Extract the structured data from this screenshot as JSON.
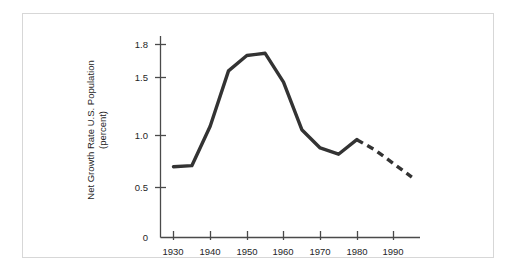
{
  "figure": {
    "background_color": "#ffffff",
    "frame_color": "#d7d7d7",
    "ink_color": "#333333",
    "text_color": "#262626"
  },
  "chart_data": {
    "type": "line",
    "title": "",
    "subtitle": "",
    "xlabel": "",
    "ylabel": "Net Growth Rate U.S. Population (percent)",
    "ylabel_line1": "Net Growth Rate U.S. Population",
    "ylabel_line2": "(percent)",
    "xlim": [
      1927,
      1998
    ],
    "ylim": [
      0,
      1.95
    ],
    "grid": false,
    "legend": "none",
    "xticks": [
      1930,
      1940,
      1950,
      1960,
      1970,
      1980,
      1990
    ],
    "xtick_labels": [
      "1930",
      "1940",
      "1950",
      "1960",
      "1970",
      "1980",
      "1990"
    ],
    "yticks": [
      0,
      0.5,
      1.0,
      1.5,
      1.8
    ],
    "ytick_labels": [
      "0",
      "0.5",
      "1.0",
      "1.5",
      "1.8"
    ],
    "series": [
      {
        "name": "Observed net growth rate",
        "style": "solid",
        "line_width": 3.4,
        "color": "#333333",
        "x": [
          1930,
          1935,
          1940,
          1945,
          1950,
          1955,
          1960,
          1965,
          1970,
          1975,
          1980
        ],
        "values": [
          0.7,
          0.71,
          1.08,
          1.56,
          1.7,
          1.72,
          1.46,
          1.05,
          0.88,
          0.82,
          0.96
        ]
      },
      {
        "name": "Projected net growth rate",
        "style": "dashed",
        "line_width": 3.4,
        "color": "#333333",
        "dash_pattern": "7,5",
        "x": [
          1980,
          1985,
          1990,
          1995
        ],
        "values": [
          0.96,
          0.86,
          0.73,
          0.6
        ]
      }
    ],
    "annotations": []
  },
  "axes": {
    "x_axis_name": "Year",
    "y_axis_name": "Net Growth Rate U.S. Population (percent)"
  }
}
